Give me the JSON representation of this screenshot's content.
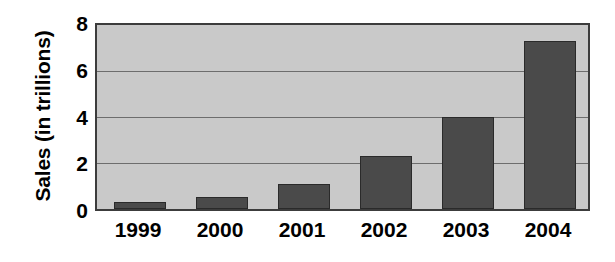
{
  "chart_data": {
    "type": "bar",
    "title": "",
    "subtitle": "",
    "xlabel": "",
    "ylabel": "Sales (in trillions)",
    "categories": [
      "1999",
      "2000",
      "2001",
      "2002",
      "2003",
      "2004"
    ],
    "values": [
      0.3,
      0.5,
      1.1,
      2.3,
      4.0,
      7.3
    ],
    "series": [
      {
        "name": "Sales",
        "values": [
          0.3,
          0.5,
          1.1,
          2.3,
          4.0,
          7.3
        ]
      }
    ],
    "ylim": [
      0,
      8
    ],
    "xlim_categories": 6,
    "y_ticks": [
      0,
      2,
      4,
      6,
      8
    ],
    "y_tick_labels": [
      "0",
      "2",
      "4",
      "6",
      "8"
    ],
    "x_tick_labels": [
      "1999",
      "2000",
      "2001",
      "2002",
      "2003",
      "2004"
    ],
    "grid": true,
    "grid_axis": "y",
    "legend": false,
    "legend_position": "none",
    "annotations": [],
    "colors": {
      "bar_fill": "#4a4a4a",
      "bar_edge": "#2a2a2a",
      "plot_background": "#c9c9c9",
      "gridline": "#6d6d6d",
      "axis_frame": "#3c3c3c",
      "text": "#000000",
      "figure_background": "#ffffff"
    }
  }
}
